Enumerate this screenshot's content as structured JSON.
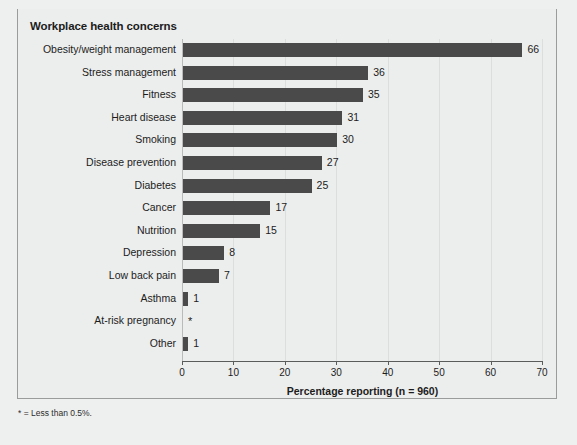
{
  "figure": {
    "title": "Workplace health concerns",
    "footnote": "* = Less than 0.5%."
  },
  "chart_data": {
    "type": "bar",
    "orientation": "horizontal",
    "title": "Workplace health concerns",
    "xlabel": "Percentage reporting (n = 960)",
    "ylabel": "",
    "xlim": [
      0,
      70
    ],
    "xticks": [
      0,
      10,
      20,
      30,
      40,
      50,
      60,
      70
    ],
    "xtick_labels": [
      "0",
      "10",
      "20",
      "30",
      "40",
      "50",
      "60",
      "70"
    ],
    "grid": true,
    "legend": "none",
    "bar_color": "#4a4a4a",
    "categories": [
      "Obesity/weight management",
      "Stress management",
      "Fitness",
      "Heart disease",
      "Smoking",
      "Disease prevention",
      "Diabetes",
      "Cancer",
      "Nutrition",
      "Depression",
      "Low back pain",
      "Asthma",
      "At-risk pregnancy",
      "Other"
    ],
    "values": [
      66,
      36,
      35,
      31,
      30,
      27,
      25,
      17,
      15,
      8,
      7,
      1,
      0,
      1
    ],
    "data_labels": [
      "66",
      "36",
      "35",
      "31",
      "30",
      "27",
      "25",
      "17",
      "15",
      "8",
      "7",
      "1",
      "*",
      "1"
    ],
    "annotations": [
      "* = Less than 0.5%."
    ]
  }
}
